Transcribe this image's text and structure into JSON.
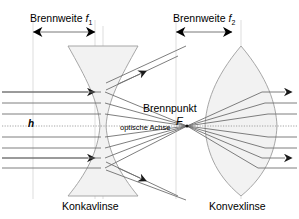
{
  "figure": {
    "title_left": "Konkavlinse",
    "title_right": "Konvexlinse",
    "labels": {
      "focal_length_left_text": "Brennweite",
      "focal_length_left_symbol": "f",
      "focal_length_left_index": "1",
      "focal_length_right_text": "Brennweite",
      "focal_length_right_symbol": "f",
      "focal_length_right_index": "2",
      "focal_point": "Brennpunkt",
      "focal_point_symbol": "F",
      "optical_axis": "optische Achse",
      "ray_height": "h"
    },
    "colors": {
      "background": "#ffffff",
      "ray": "#6f6f6f",
      "lens_outline": "#9a9a9a",
      "lens_fill": "#f0f0f0",
      "guide_line": "#c8c8c8",
      "text": "#000000",
      "arrow_head": "#1a1a1a"
    },
    "geometry": {
      "optical_axis_y": 126,
      "focal_point_x": 187,
      "focal_point_y": 126,
      "concave_lens_center_x": 103,
      "convex_lens_center_x": 241,
      "lens_top_y": 46,
      "lens_bottom_y": 196,
      "dimension_arrow_y": 32,
      "f1_arrow_from_x": 33,
      "f1_arrow_to_x": 95,
      "f2_arrow_from_x": 176,
      "f2_arrow_to_x": 232,
      "incoming_ray_y": [
        92,
        103,
        114,
        126,
        137,
        148,
        158,
        168
      ],
      "ray_count": 8
    }
  }
}
